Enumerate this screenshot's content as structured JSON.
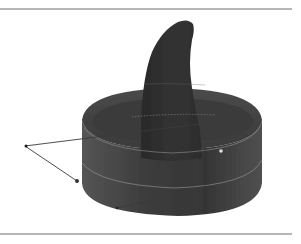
{
  "figure": {
    "colors": {
      "background": "#ffffff",
      "rule": "#6e6e6e",
      "surface_dark": "#2e2e2e",
      "surface_mid": "#444444",
      "surface_light": "#5a5a5a",
      "highlight_line": "#9a9a9a",
      "wire": "#3a3a3a"
    },
    "rules": {
      "top_y": 9,
      "bottom_y": 234,
      "x_start": 0,
      "x_end": 292
    },
    "wire_points": [
      {
        "label": "apex",
        "x": 25,
        "y": 146
      },
      {
        "label": "upper-contact",
        "x": 83,
        "y": 128
      },
      {
        "label": "lower-contact",
        "x": 77,
        "y": 181
      },
      {
        "label": "base-contact",
        "x": 117,
        "y": 208
      }
    ]
  }
}
